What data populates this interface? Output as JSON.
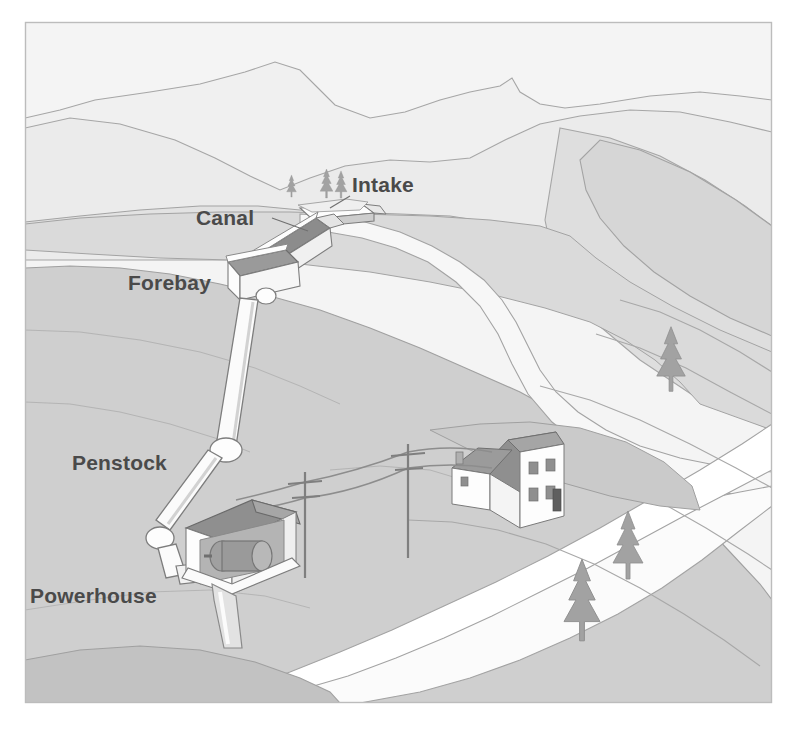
{
  "figure": {
    "name": "run-of-river-hydroelectric-scheme",
    "orientation": "landscape-oblique-aerial",
    "style": "grayscale line illustration",
    "frame": {
      "border_color": "#b9b9b9",
      "background_color": "#ffffff",
      "inset_left": 25,
      "inset_top": 22,
      "inset_right": 772,
      "inset_bottom": 703
    }
  },
  "palette": {
    "paper": "#ffffff",
    "sky": "#f2f2f2",
    "ridge_far": "#eeeeee",
    "ridge_mid": "#e4e4e4",
    "hill_upper": "#dcdcdc",
    "hill_mid": "#d2d2d2",
    "hill_lower": "#c8c8c8",
    "valley_floor": "#bfbfbf",
    "slope_dark": "#b4b4b4",
    "river_water": "#fbfbfb",
    "river_bank": "#e8e8e8",
    "outline": "#9a9a9a",
    "outline_soft": "#ababab",
    "structure_white": "#fdfdfd",
    "structure_shadow": "#c9c9c9",
    "structure_dark": "#8c8c8c",
    "roof_dark": "#8f8f8f",
    "roof_mid": "#a8a8a8",
    "machinery": "#9b9b9b",
    "tree": "#a0a0a0",
    "tree_dark": "#8a8a8a",
    "pole": "#8a8a8a",
    "label_text": "#4a4a4a"
  },
  "labels": [
    {
      "id": "intake",
      "text": "Intake",
      "x": 352,
      "y": 192,
      "anchor": "start",
      "leader": true
    },
    {
      "id": "canal",
      "text": "Canal",
      "x": 196,
      "y": 225,
      "anchor": "start",
      "leader": true
    },
    {
      "id": "forebay",
      "text": "Forebay",
      "x": 128,
      "y": 290,
      "anchor": "start",
      "leader": false
    },
    {
      "id": "penstock",
      "text": "Penstock",
      "x": 72,
      "y": 470,
      "anchor": "start",
      "leader": false
    },
    {
      "id": "powerhouse",
      "text": "Powerhouse",
      "x": 30,
      "y": 603,
      "anchor": "start",
      "leader": false
    }
  ],
  "components": [
    {
      "id": "intake",
      "label": "Intake",
      "description": "Low diversion weir across the mountain stream that captures river flow",
      "position": {
        "x": 318,
        "y": 213
      }
    },
    {
      "id": "canal",
      "label": "Canal",
      "description": "Open channel conveying diverted water along the hillside contour to the forebay",
      "position": {
        "x": 285,
        "y": 245
      }
    },
    {
      "id": "forebay",
      "label": "Forebay",
      "description": "Open settling tank at the head of the penstock",
      "position": {
        "x": 248,
        "y": 275
      }
    },
    {
      "id": "penstock",
      "label": "Penstock",
      "description": "Pressure pipe on anchor blocks dropping steeply down the slope to the turbine",
      "position": {
        "x": 205,
        "y": 400
      }
    },
    {
      "id": "powerhouse",
      "label": "Powerhouse",
      "description": "Cut-away building housing the turbine and generator, with tailrace returning water to the river",
      "position": {
        "x": 232,
        "y": 545
      }
    }
  ],
  "scenery": {
    "river_label": "river",
    "trees": [
      {
        "id": "tree-intake-left",
        "x": 291,
        "y": 190,
        "size": 0.45
      },
      {
        "id": "tree-intake-mid",
        "x": 328,
        "y": 193,
        "size": 0.62
      },
      {
        "id": "tree-intake-right",
        "x": 343,
        "y": 193,
        "size": 0.58
      },
      {
        "id": "tree-right-upper",
        "x": 672,
        "y": 360,
        "size": 1.0
      },
      {
        "id": "tree-right-mid",
        "x": 628,
        "y": 545,
        "size": 1.05
      },
      {
        "id": "tree-right-lower",
        "x": 583,
        "y": 600,
        "size": 1.25
      }
    ],
    "utility_poles": [
      {
        "id": "pole-left",
        "x": 305,
        "y": 482
      },
      {
        "id": "pole-right",
        "x": 408,
        "y": 458
      }
    ],
    "house": {
      "id": "farmhouse",
      "x": 508,
      "y": 462,
      "roof_color": "#8f8f8f",
      "wall_color": "#fdfdfd",
      "windows": 6,
      "chimney": true
    }
  }
}
